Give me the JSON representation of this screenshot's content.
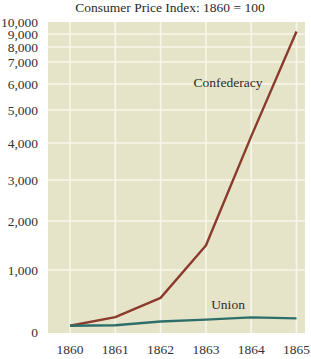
{
  "chart_data": {
    "type": "line",
    "title": "Consumer Price Index: 1860 = 100",
    "xlabel": "",
    "ylabel": "",
    "x": [
      1860,
      1861,
      1862,
      1863,
      1864,
      1865
    ],
    "x_tick_labels": [
      "1860",
      "1861",
      "1862",
      "1863",
      "1864",
      "1865"
    ],
    "y_ticks": [
      0,
      1000,
      2000,
      3000,
      4000,
      5000,
      6000,
      7000,
      8000,
      9000,
      10000
    ],
    "y_tick_labels": [
      "0",
      "1,000",
      "2,000",
      "3,000",
      "4,000",
      "5,000",
      "6,000",
      "7,000",
      "8,000",
      "9,000",
      "10,000"
    ],
    "ylim": [
      0,
      10000
    ],
    "y_scale": "compressed (non-linear, spacing shrinks toward top)",
    "grid": true,
    "legend": "inline labels",
    "series": [
      {
        "name": "Confederacy",
        "color": "#8b3a2b",
        "values": [
          100,
          240,
          550,
          1500,
          4200,
          9200
        ]
      },
      {
        "name": "Union",
        "color": "#2f6f6a",
        "values": [
          100,
          110,
          170,
          200,
          235,
          220
        ]
      }
    ],
    "annotations": [
      {
        "text": "Confederacy",
        "x": 1863.8,
        "y": 6000
      },
      {
        "text": "Union",
        "x": 1863.5,
        "y": 400
      }
    ]
  },
  "colors": {
    "plot_background": "#e5e4c9",
    "gridline": "#f7f6ea",
    "confederacy": "#8b3a2b",
    "union": "#2f6f6a"
  }
}
